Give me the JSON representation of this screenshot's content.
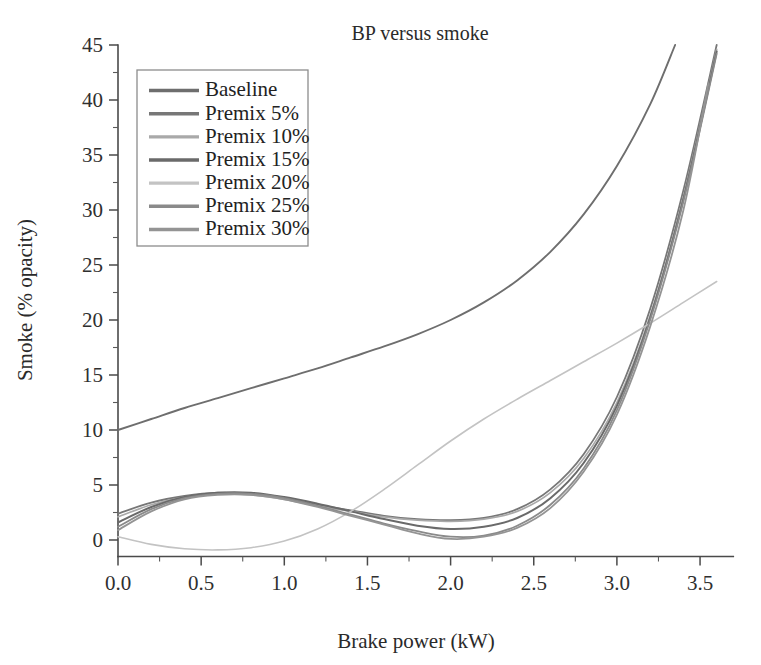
{
  "chart_data": {
    "type": "line",
    "title": "BP versus smoke",
    "xlabel": "Brake power (kW)",
    "ylabel": "Smoke (% opacity)",
    "xlim": [
      0.0,
      3.7
    ],
    "ylim": [
      -1.5,
      45
    ],
    "grid": false,
    "legend_position": "top-left",
    "xticks": [
      0.0,
      0.5,
      1.0,
      1.5,
      2.0,
      2.5,
      3.0,
      3.5
    ],
    "xtick_labels": [
      "0.0",
      "0.5",
      "1.0",
      "1.5",
      "2.0",
      "2.5",
      "3.0",
      "3.5"
    ],
    "xminor_step": 0.25,
    "yticks": [
      0,
      5,
      10,
      15,
      20,
      25,
      30,
      35,
      40,
      45
    ],
    "ytick_labels": [
      "0",
      "5",
      "10",
      "15",
      "20",
      "25",
      "30",
      "35",
      "40",
      "45"
    ],
    "yminor_step": 2.5,
    "x": [
      0.0,
      0.2,
      0.4,
      0.6,
      0.8,
      1.0,
      1.2,
      1.4,
      1.6,
      1.8,
      2.0,
      2.2,
      2.4,
      2.6,
      2.8,
      3.0,
      3.2,
      3.4,
      3.6
    ],
    "series": [
      {
        "name": "Baseline",
        "color": "#6e6e6e",
        "width": 1.9,
        "x": [
          0.0,
          0.2,
          0.4,
          0.6,
          0.8,
          1.0,
          1.2,
          1.4,
          1.6,
          1.8,
          2.0,
          2.2,
          2.4,
          2.6,
          2.8,
          3.0,
          3.2,
          3.35
        ],
        "values": [
          10.0,
          11.0,
          12.0,
          12.9,
          13.8,
          14.7,
          15.6,
          16.6,
          17.6,
          18.7,
          20.0,
          21.6,
          23.6,
          26.2,
          29.6,
          34.0,
          39.6,
          45.0
        ]
      },
      {
        "name": "Premix 5%",
        "color": "#777777",
        "width": 1.8,
        "x": [
          0.0,
          0.2,
          0.4,
          0.6,
          0.8,
          1.0,
          1.2,
          1.4,
          1.6,
          1.8,
          2.0,
          2.2,
          2.4,
          2.6,
          2.8,
          3.0,
          3.2,
          3.4,
          3.6
        ],
        "values": [
          2.4,
          3.4,
          4.0,
          4.3,
          4.2,
          3.8,
          3.2,
          2.7,
          2.2,
          1.9,
          1.8,
          2.0,
          2.8,
          4.6,
          7.8,
          13.0,
          21.0,
          31.8,
          45.0
        ]
      },
      {
        "name": "Premix 10%",
        "color": "#a9a9a9",
        "width": 1.7,
        "x": [
          0.0,
          0.2,
          0.4,
          0.6,
          0.8,
          1.0,
          1.2,
          1.4,
          1.6,
          1.8,
          2.0,
          2.2,
          2.4,
          2.6,
          2.8,
          3.0,
          3.2,
          3.4,
          3.6
        ],
        "values": [
          2.1,
          3.2,
          3.9,
          4.2,
          4.1,
          3.7,
          3.1,
          2.6,
          2.1,
          1.8,
          1.7,
          1.9,
          2.6,
          4.3,
          7.4,
          12.5,
          20.4,
          31.2,
          44.6
        ]
      },
      {
        "name": "Premix 15%",
        "color": "#6a6a6a",
        "width": 2.0,
        "x": [
          0.0,
          0.2,
          0.4,
          0.6,
          0.8,
          1.0,
          1.2,
          1.4,
          1.6,
          1.8,
          2.0,
          2.2,
          2.4,
          2.6,
          2.8,
          3.0,
          3.2,
          3.4,
          3.6
        ],
        "values": [
          1.6,
          3.0,
          3.9,
          4.3,
          4.3,
          3.9,
          3.3,
          2.6,
          1.9,
          1.3,
          1.0,
          1.2,
          2.0,
          3.8,
          7.0,
          12.2,
          20.2,
          31.0,
          44.4
        ]
      },
      {
        "name": "Premix 20%",
        "color": "#c3c3c3",
        "width": 1.6,
        "x": [
          0.0,
          0.2,
          0.4,
          0.6,
          0.8,
          1.0,
          1.2,
          1.4,
          1.6,
          1.8,
          2.0,
          2.2,
          2.4,
          2.6,
          2.8,
          3.0,
          3.2,
          3.4,
          3.6
        ],
        "values": [
          0.3,
          -0.4,
          -0.8,
          -0.9,
          -0.7,
          -0.1,
          1.0,
          2.6,
          4.6,
          6.8,
          9.0,
          11.0,
          12.8,
          14.5,
          16.2,
          17.9,
          19.7,
          21.6,
          23.5
        ]
      },
      {
        "name": "Premix 25%",
        "color": "#8a8a8a",
        "width": 1.8,
        "x": [
          0.0,
          0.2,
          0.4,
          0.6,
          0.8,
          1.0,
          1.2,
          1.4,
          1.6,
          1.8,
          2.0,
          2.2,
          2.4,
          2.6,
          2.8,
          3.0,
          3.2,
          3.4,
          3.6
        ],
        "values": [
          1.2,
          2.8,
          3.8,
          4.2,
          4.2,
          3.8,
          3.1,
          2.3,
          1.5,
          0.8,
          0.3,
          0.4,
          1.3,
          3.2,
          6.5,
          11.8,
          20.0,
          30.8,
          44.2
        ]
      },
      {
        "name": "Premix 30%",
        "color": "#949494",
        "width": 1.8,
        "x": [
          0.0,
          0.2,
          0.4,
          0.6,
          0.8,
          1.0,
          1.2,
          1.4,
          1.6,
          1.8,
          2.0,
          2.2,
          2.4,
          2.6,
          2.8,
          3.0,
          3.2,
          3.4,
          3.55
        ],
        "values": [
          0.9,
          2.6,
          3.7,
          4.1,
          4.1,
          3.7,
          3.0,
          2.2,
          1.4,
          0.6,
          0.1,
          0.3,
          1.1,
          2.9,
          6.2,
          11.4,
          19.4,
          30.0,
          41.5
        ]
      }
    ]
  },
  "legend": {
    "items": [
      {
        "label": "Baseline"
      },
      {
        "label": "Premix 5%"
      },
      {
        "label": "Premix 10%"
      },
      {
        "label": "Premix 15%"
      },
      {
        "label": "Premix 20%"
      },
      {
        "label": "Premix 25%"
      },
      {
        "label": "Premix 30%"
      }
    ]
  },
  "colors": {
    "background": "#ffffff",
    "axis": "#4a4a4a",
    "text": "#2a2a2a",
    "legend_border": "#8d8d8d"
  }
}
